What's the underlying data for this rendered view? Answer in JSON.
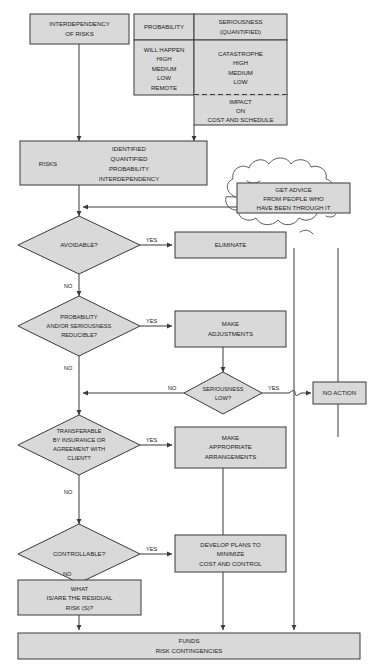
{
  "diagram": {
    "colors": {
      "shape_fill": "#d9d9d9",
      "shape_stroke": "#3a3a3a",
      "text": "#1a1a1a",
      "background": "#ffffff",
      "caption": "#8d8d8d"
    }
  },
  "nodes": {
    "interdependency": {
      "line1": "INTERDEPENDENCY",
      "line2": "OF RISKS"
    },
    "table": {
      "header_probability": "PROBABILITY",
      "header_seriousness_1": "SERIOUSNESS",
      "header_seriousness_2": "(QUANTIFIED)",
      "probability_values": [
        "WILL HAPPEN",
        "HIGH",
        "MEDIUM",
        "LOW",
        "REMOTE"
      ],
      "seriousness_values": [
        "CATASTROPHE",
        "HIGH",
        "MEDIUM",
        "LOW"
      ],
      "impact": [
        "IMPACT",
        "ON",
        "COST AND SCHEDULE"
      ]
    },
    "risks": {
      "label": "RISKS",
      "items": [
        "IDENTIFIED",
        "QUANTIFIED",
        "PROBABILITY",
        "INTERDEPENDENCY"
      ]
    },
    "advice": [
      "GET ADVICE",
      "FROM PEOPLE WHO",
      "HAVE BEEN THROUGH IT"
    ],
    "avoidable": "AVOIDABLE?",
    "eliminate": "ELIMINATE",
    "reducible": [
      "PROBABILITY",
      "AND/OR SERIOUSNESS",
      "REDUCIBLE?"
    ],
    "make_adjustments": [
      "MAKE",
      "ADJUSTMENTS"
    ],
    "seriousness_low": [
      "SERIOUSNESS",
      "LOW?"
    ],
    "no_action": "NO ACTION",
    "transferable": [
      "TRANSFERABLE",
      "BY INSURANCE OR",
      "AGREEMENT WITH",
      "CLIENT?"
    ],
    "make_arrangements": [
      "MAKE",
      "APPROPRIATE",
      "ARRANGEMENTS"
    ],
    "controllable": "CONTROLLABLE?",
    "develop_plans": [
      "DEVELOP PLANS TO",
      "MINIMIZE",
      "COST AND CONTROL"
    ],
    "residual": [
      "WHAT",
      "IS/ARE THE RESIDUAL",
      "RISK (S)?"
    ],
    "funds": [
      "FUNDS",
      "RISK CONTINGENCIES"
    ]
  },
  "edge_labels": {
    "yes_avoidable": "YES",
    "no_avoidable": "NO",
    "yes_reducible": "YES",
    "no_reducible": "NO",
    "no_seriousness": "NO",
    "yes_seriousness": "YES",
    "yes_transferable": "YES",
    "no_transferable": "NO",
    "yes_controllable": "YES",
    "no_controllable": "NO"
  }
}
